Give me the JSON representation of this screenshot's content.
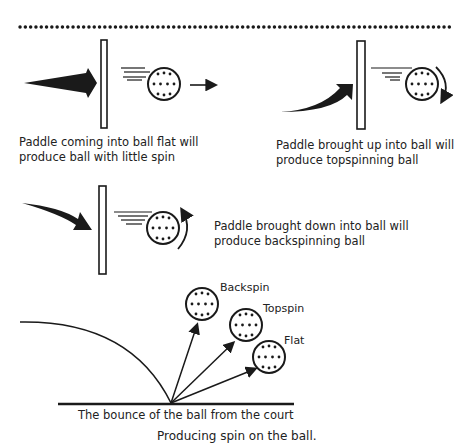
{
  "diagram": {
    "caption": "Producing spin on the ball.",
    "panels": {
      "flat": {
        "line1": "Paddle coming into ball flat will",
        "line2": "produce ball with little spin"
      },
      "topspin": {
        "line1": "Paddle brought up into ball will",
        "line2": "produce topspinning ball"
      },
      "backspin": {
        "line1": "Paddle brought down into ball will",
        "line2": "produce backspinning ball"
      }
    },
    "bounce": {
      "label": "The bounce of the ball from the court",
      "balls": [
        {
          "label": "Backspin"
        },
        {
          "label": "Topspin"
        },
        {
          "label": "Flat"
        }
      ]
    },
    "colors": {
      "ink": "#1a1a1a",
      "background": "#ffffff"
    }
  }
}
